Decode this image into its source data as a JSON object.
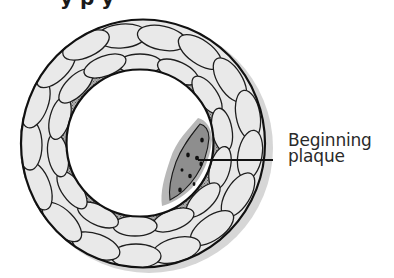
{
  "diagram": {
    "title_fragment": "y p y",
    "labels": [
      {
        "id": "plaque",
        "lines": [
          "Beginning",
          "plaque"
        ]
      }
    ],
    "colors": {
      "outline": "#1a1a1a",
      "wall_fill": "#e6e6e6",
      "shadow": "#cfcfcf",
      "gap_fill": "#9a9a9a",
      "plaque_fill": "#8c8c8c",
      "plaque_halo": "#b5b5b5",
      "lumen": "#ffffff",
      "text": "#2a2a2a"
    }
  }
}
